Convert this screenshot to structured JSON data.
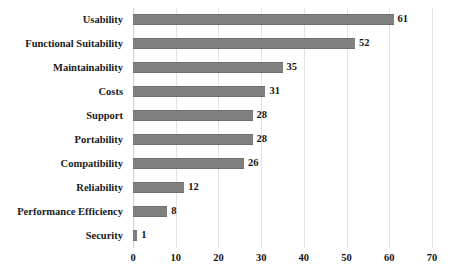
{
  "chart_data": {
    "type": "bar",
    "orientation": "horizontal",
    "title": "",
    "subtitle": "",
    "xlabel": "",
    "ylabel": "",
    "categories": [
      "Usability",
      "Functional Suitability",
      "Maintainability",
      "Costs",
      "Support",
      "Portability",
      "Compatibility",
      "Reliability",
      "Performance Efficiency",
      "Security"
    ],
    "values": [
      61,
      52,
      35,
      31,
      28,
      28,
      26,
      12,
      8,
      1
    ],
    "data_labels": [
      "61",
      "52",
      "35",
      "31",
      "28",
      "28",
      "26",
      "12",
      "8",
      "1"
    ],
    "xlim": [
      0,
      70
    ],
    "xticks": [
      0,
      10,
      20,
      30,
      40,
      50,
      60,
      70
    ],
    "xtick_labels": [
      "0",
      "10",
      "20",
      "30",
      "40",
      "50",
      "60",
      "70"
    ],
    "grid": "vertical",
    "legend": "none",
    "bar_color": "#808080",
    "grid_color": "#e2e2e2",
    "text_color": "#1a1a1a",
    "background": "#ffffff"
  }
}
